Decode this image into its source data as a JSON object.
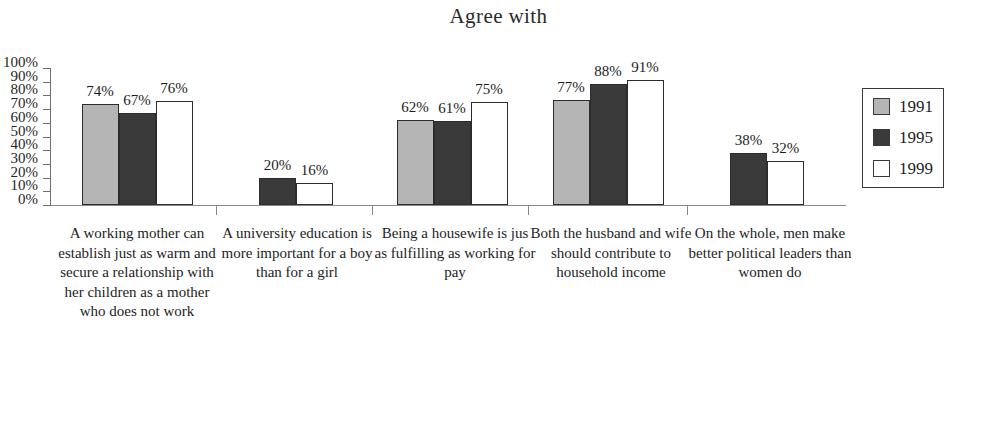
{
  "chart_data": {
    "type": "bar",
    "title": "Agree with",
    "xlabel": "",
    "ylabel": "",
    "ylim": [
      0,
      100
    ],
    "grid": false,
    "legend_position": "right",
    "y_ticks": [
      "100%",
      "90%",
      "80%",
      "70%",
      "60%",
      "50%",
      "40%",
      "30%",
      "20%",
      "10%",
      "0%"
    ],
    "categories": [
      "A working mother can establish just as warm and secure a relationship with her children as a mother who does not work",
      "A university education is more important for a boy than for a girl",
      "Being a housewife is jus as fulfilling as working for pay",
      "Both the husband and wife should contribute to household income",
      "On the whole, men make better political leaders than women do"
    ],
    "series": [
      {
        "name": "1991",
        "color": "#b5b5b5",
        "values": [
          74,
          null,
          62,
          77,
          null
        ]
      },
      {
        "name": "1995",
        "color": "#3a3a3a",
        "values": [
          67,
          20,
          61,
          88,
          38
        ]
      },
      {
        "name": "1999",
        "color": "#ffffff",
        "values": [
          76,
          16,
          75,
          91,
          32
        ]
      }
    ]
  },
  "axis": {
    "ticks": [
      {
        "label": "100%",
        "value": 100
      },
      {
        "label": "90%",
        "value": 90
      },
      {
        "label": "80%",
        "value": 80
      },
      {
        "label": "70%",
        "value": 70
      },
      {
        "label": "60%",
        "value": 60
      },
      {
        "label": "50%",
        "value": 50
      },
      {
        "label": "40%",
        "value": 40
      },
      {
        "label": "30%",
        "value": 30
      },
      {
        "label": "20%",
        "value": 20
      },
      {
        "label": "10%",
        "value": 10
      },
      {
        "label": "0%",
        "value": 0
      }
    ]
  },
  "groups": [
    {
      "label": "A working mother can establish just as warm and secure a relationship with her children as a mother who does not work",
      "bars": [
        {
          "series": "1991",
          "value": 74,
          "value_label": "74%"
        },
        {
          "series": "1995",
          "value": 67,
          "value_label": "67%"
        },
        {
          "series": "1999",
          "value": 76,
          "value_label": "76%"
        }
      ]
    },
    {
      "label": "A university education is more important for a boy than for a girl",
      "bars": [
        {
          "series": "1995",
          "value": 20,
          "value_label": "20%"
        },
        {
          "series": "1999",
          "value": 16,
          "value_label": "16%"
        }
      ]
    },
    {
      "label": "Being a housewife is jus as fulfilling as working for pay",
      "bars": [
        {
          "series": "1991",
          "value": 62,
          "value_label": "62%"
        },
        {
          "series": "1995",
          "value": 61,
          "value_label": "61%"
        },
        {
          "series": "1999",
          "value": 75,
          "value_label": "75%"
        }
      ]
    },
    {
      "label": "Both the husband and wife should contribute to household income",
      "bars": [
        {
          "series": "1991",
          "value": 77,
          "value_label": "77%"
        },
        {
          "series": "1995",
          "value": 88,
          "value_label": "88%"
        },
        {
          "series": "1999",
          "value": 91,
          "value_label": "91%"
        }
      ]
    },
    {
      "label": "On the whole, men make better political leaders than women do",
      "bars": [
        {
          "series": "1995",
          "value": 38,
          "value_label": "38%"
        },
        {
          "series": "1999",
          "value": 32,
          "value_label": "32%"
        }
      ]
    }
  ],
  "legend": {
    "items": [
      {
        "label": "1991",
        "color": "#b5b5b5"
      },
      {
        "label": "1995",
        "color": "#3a3a3a"
      },
      {
        "label": "1999",
        "color": "#ffffff"
      }
    ]
  }
}
